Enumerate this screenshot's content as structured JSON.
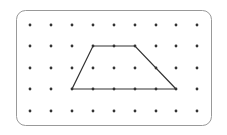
{
  "figure": {
    "type": "dot-grid-shape",
    "grid": {
      "columns": 9,
      "rows": 5,
      "x": [
        30,
        51,
        72,
        93,
        114,
        135,
        156,
        176,
        197
      ],
      "y": [
        25,
        46,
        68,
        89,
        111
      ]
    },
    "shape": {
      "name": "trapezoid",
      "vertices_grid": [
        [
          3,
          1
        ],
        [
          5,
          1
        ],
        [
          7,
          3
        ],
        [
          2,
          3
        ]
      ]
    },
    "colors": {
      "dot": "#333333",
      "line": "#333333",
      "border": "#999999"
    }
  }
}
